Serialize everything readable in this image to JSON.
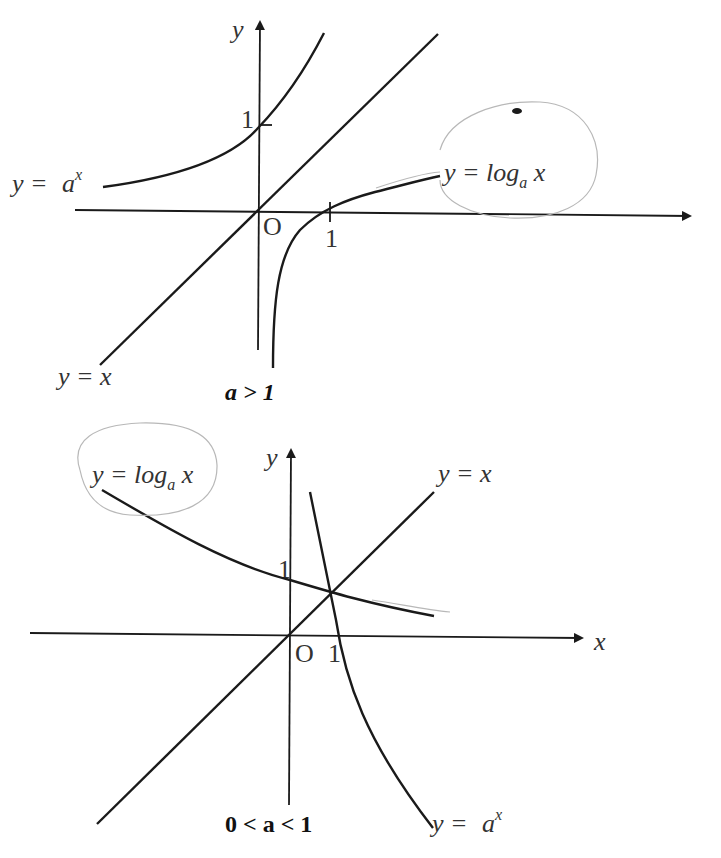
{
  "diagrams": [
    {
      "caption": "a > 1",
      "labels": {
        "y_axis": "y",
        "origin": "O",
        "x_tick": "1",
        "y_tick": "1",
        "exp_prefix": "y = ",
        "exp_base": "a",
        "exp_power": "x",
        "log_prefix": "y = log",
        "log_base": "a",
        "log_arg": " x",
        "identity": "y = x"
      }
    },
    {
      "caption": "0 < a < 1",
      "labels": {
        "y_axis": "y",
        "x_axis": "x",
        "origin": "O",
        "x_tick": "1",
        "y_tick": "1",
        "exp_prefix": "y = ",
        "exp_base": "a",
        "exp_power": "x",
        "log_prefix": "y = log",
        "log_base": "a",
        "log_arg": " x",
        "identity": "y = x"
      }
    }
  ],
  "colors": {
    "ink": "#1a1a1a",
    "label": "#333333",
    "pencil": "#b8b8b8"
  }
}
